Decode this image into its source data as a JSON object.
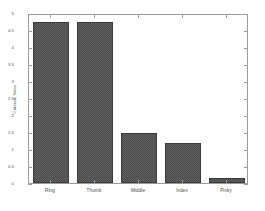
{
  "chart_data": {
    "type": "bar",
    "title": "",
    "xlabel": "",
    "ylabel": "Criterion Value",
    "categories": [
      "Ring",
      "Thumb",
      "Middle",
      "Index",
      "Pinky"
    ],
    "values": [
      4.75,
      4.73,
      1.47,
      1.18,
      0.15
    ],
    "ylim": [
      0,
      5
    ],
    "yticks": [
      "0",
      "0.5",
      "1",
      "1.5",
      "2",
      "2.5",
      "3",
      "3.5",
      "4",
      "4.5",
      "5"
    ],
    "ytick_values": [
      0,
      0.5,
      1,
      1.5,
      2,
      2.5,
      3,
      3.5,
      4,
      4.5,
      5
    ],
    "grid": false,
    "legend": "none",
    "bar_color": "#4a4a4a",
    "bar_edge_color": "#3a3a3a",
    "axis_color": "#9a9a9a",
    "background_color": "#ffffff"
  }
}
